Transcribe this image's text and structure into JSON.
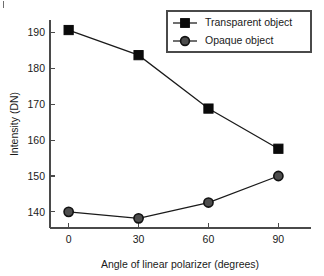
{
  "chart_data": {
    "type": "line",
    "title": "",
    "subtitle": "",
    "xlabel": "Angle of linear polarizer (degrees)",
    "ylabel": "Intensity (DN)",
    "x": [
      0,
      30,
      60,
      90
    ],
    "xticklabels": [
      "0",
      "30",
      "60",
      "90"
    ],
    "yticks": [
      140,
      150,
      160,
      170,
      180,
      190
    ],
    "yticklabels": [
      "140",
      "150",
      "160",
      "170",
      "180",
      "190"
    ],
    "xlim": [
      -8,
      104
    ],
    "ylim": [
      135.5,
      193.5
    ],
    "grid": false,
    "legend_position": "top-right",
    "series": [
      {
        "name": "Transparent object",
        "marker": "square",
        "marker_color": "#0a0a0a",
        "line_color": "#1a1a1a",
        "values": [
          190.7,
          183.7,
          168.8,
          157.6
        ]
      },
      {
        "name": "Opaque object",
        "marker": "circle",
        "marker_color": "#4d4d4d",
        "line_color": "#1a1a1a",
        "values": [
          140.0,
          138.2,
          142.6,
          150.0
        ]
      }
    ]
  },
  "figure": {
    "axis_color": "#4a4a4a",
    "text_color": "#1a1a1a",
    "background": "#ffffff"
  },
  "legend": {
    "entries": [
      {
        "label": "Transparent object",
        "marker": "square-marker"
      },
      {
        "label": "Opaque object",
        "marker": "circle-marker"
      }
    ]
  }
}
